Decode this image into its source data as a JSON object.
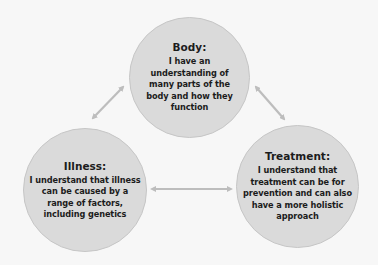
{
  "diagram": {
    "type": "cycle",
    "colors": {
      "background": "#f7f7f7",
      "circle_fill": "#dadada",
      "circle_border": "#c6c6c6",
      "text": "#1c1c1c",
      "arrow": "#bdbdbd"
    },
    "nodes": [
      {
        "id": "body",
        "title": "Body:",
        "text": "I have an understanding of many parts of the body and how they function"
      },
      {
        "id": "illness",
        "title": "Illness:",
        "text": "I understand that illness can be caused by a range of factors, including genetics"
      },
      {
        "id": "treatment",
        "title": "Treatment:",
        "text": "I understand that treatment can be for prevention and can also have a more holistic approach"
      }
    ],
    "connections": [
      {
        "from": "body",
        "to": "illness",
        "bidirectional": true
      },
      {
        "from": "body",
        "to": "treatment",
        "bidirectional": true
      },
      {
        "from": "illness",
        "to": "treatment",
        "bidirectional": true
      }
    ]
  }
}
